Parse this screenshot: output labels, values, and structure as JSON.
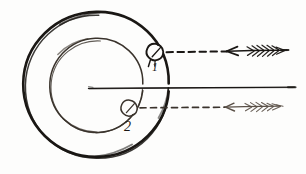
{
  "figure": {
    "style": "pen-and-ink sketch on off-white paper",
    "background_color": "#fdfdfc",
    "ink_color": "#1a1714",
    "ink_color_soft": "#3a332c",
    "ink_color_light": "#5a5047",
    "width": 306,
    "height": 174
  },
  "labels": [
    {
      "id": "label-1",
      "text": "1",
      "x": 152,
      "y": 70,
      "font_size": 11
    },
    {
      "id": "label-2",
      "text": "2",
      "x": 125,
      "y": 130,
      "font_size": 13
    }
  ],
  "shapes": {
    "outer_circle": {
      "name": "outer-circle",
      "center_x": 96,
      "center_y": 85,
      "radius": 73,
      "stroke_width": 2.4
    },
    "inner_circle": {
      "name": "inner-circle",
      "center_x": 96,
      "center_y": 86,
      "radius": 47,
      "stroke_width": 1.5
    },
    "marker_1": {
      "name": "entry-point-1",
      "center_x": 157,
      "center_y": 52,
      "radius": 6.5,
      "stroke_width": 1.8
    },
    "marker_2": {
      "name": "entry-point-2",
      "center_x": 131,
      "center_y": 108,
      "radius": 6.5,
      "stroke_width": 1.4
    }
  },
  "rays": {
    "top_ray": {
      "name": "incident-ray-top",
      "y": 52,
      "dash_start_x": 166,
      "dash_end_x": 228,
      "arrow_tip_x": 228,
      "shaft_end_x": 288,
      "fletching_start_x": 246,
      "fletching_end_x": 282,
      "direction": "leftward",
      "style": "dashed"
    },
    "axis_ray": {
      "name": "optical-axis",
      "y": 88,
      "start_x": 88,
      "end_x": 296,
      "style": "solid"
    },
    "bottom_ray": {
      "name": "incident-ray-bottom",
      "y": 108,
      "dash_start_x": 140,
      "dash_end_x": 226,
      "arrow_tip_x": 226,
      "shaft_end_x": 286,
      "fletching_start_x": 243,
      "fletching_end_x": 281,
      "direction": "leftward",
      "style": "dashed"
    }
  }
}
